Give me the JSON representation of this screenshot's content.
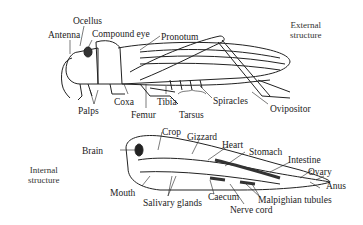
{
  "external": {
    "section_label": [
      "External",
      "structure"
    ],
    "labels": {
      "ocellus": "Ocellus",
      "antenna": "Antenna",
      "compound_eye": "Compound eye",
      "pronotum": "Pronotum",
      "palps": "Palps",
      "coxa": "Coxa",
      "femur": "Femur",
      "tibia": "Tibia",
      "tarsus": "Tarsus",
      "spiracles": "Spiracles",
      "ovipositor": "Ovipositor"
    }
  },
  "internal": {
    "section_label": [
      "Internal",
      "structure"
    ],
    "labels": {
      "brain": "Brain",
      "crop": "Crop",
      "gizzard": "Gizzard",
      "heart": "Heart",
      "stomach": "Stomach",
      "intestine": "Intestine",
      "ovary": "Ovary",
      "anus": "Anus",
      "mouth": "Mouth",
      "salivary_glands": "Salivary glands",
      "caecum": "Caecum",
      "malpighian_tubules": "Malpighian tubules",
      "nerve_cord": "Nerve cord"
    }
  }
}
